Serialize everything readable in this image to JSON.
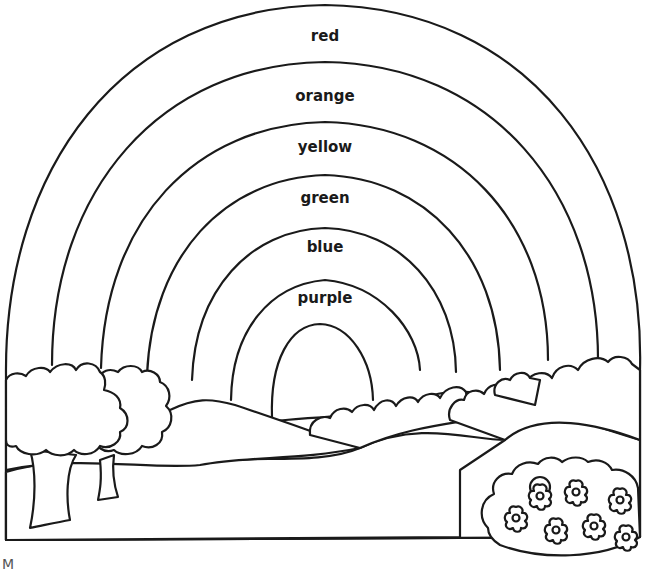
{
  "page": {
    "type": "coloring-sheet"
  },
  "rainbow": {
    "bands": [
      {
        "label": "red",
        "color": "#e53935"
      },
      {
        "label": "orange",
        "color": "#fb8c00"
      },
      {
        "label": "yellow",
        "color": "#fdd835"
      },
      {
        "label": "green",
        "color": "#43a047"
      },
      {
        "label": "blue",
        "color": "#1e88e5"
      },
      {
        "label": "purple",
        "color": "#8e24aa"
      }
    ]
  },
  "scene": {
    "elements": [
      "trees",
      "hills",
      "bushes",
      "flower-bush"
    ],
    "flower_count": 7
  },
  "footer": {
    "corner_text": "M"
  }
}
